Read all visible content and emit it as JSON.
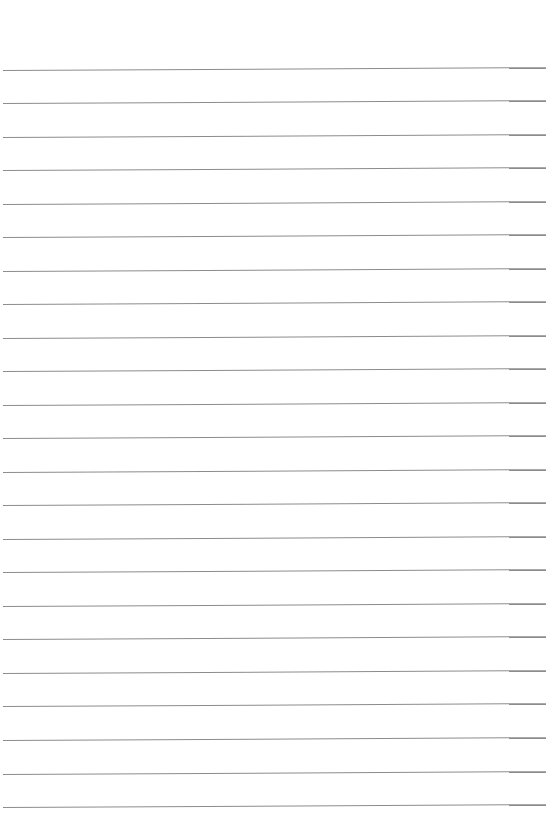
{
  "page": {
    "type": "ruled-paper",
    "background_color": "#ffffff",
    "rule_color": "#8c8c8c",
    "rule_count": 23,
    "rule_positions_y": [
      70,
      103,
      137,
      170,
      204,
      237,
      271,
      304,
      338,
      371,
      405,
      438,
      472,
      505,
      539,
      572,
      606,
      639,
      673,
      706,
      740,
      774,
      807
    ],
    "text": ""
  }
}
